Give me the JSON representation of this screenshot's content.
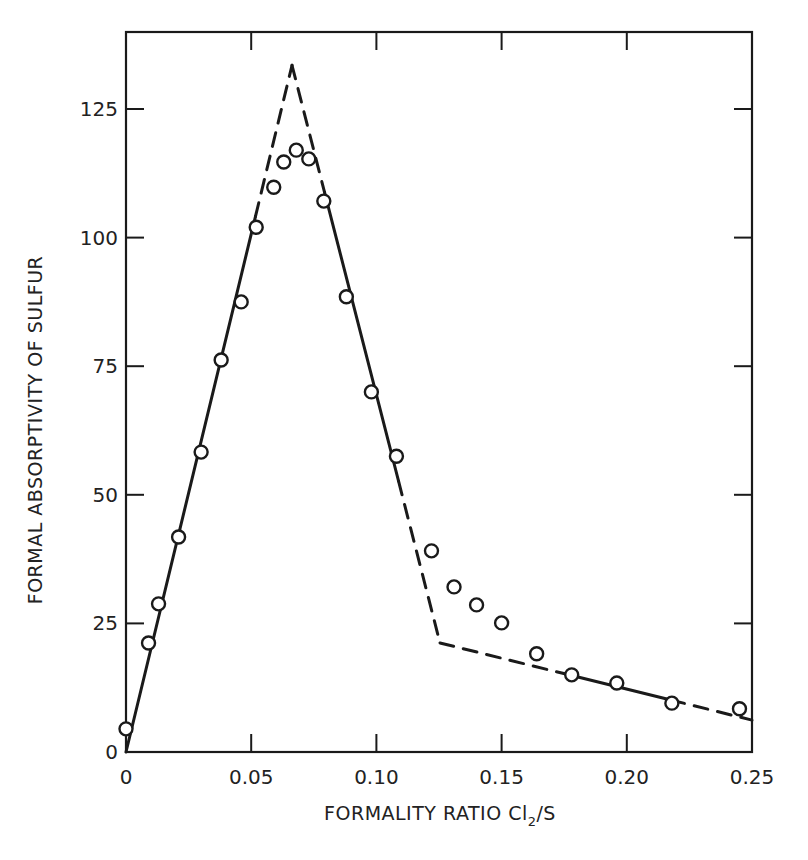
{
  "chart_data": {
    "type": "scatter",
    "title": "",
    "xlabel": "FORMALITY RATIO Cl2/S",
    "xlabel_main": "FORMALITY RATIO Cl",
    "xlabel_sub": "2",
    "xlabel_tail": "/S",
    "ylabel": "FORMAL ABSORPTIVITY OF SULFUR",
    "xlim": [
      0,
      0.25
    ],
    "ylim": [
      0,
      140
    ],
    "grid": false,
    "legend": null,
    "x_ticks": [
      0,
      0.05,
      0.1,
      0.15,
      0.2,
      0.25
    ],
    "x_tick_labels": [
      "0",
      "0.05",
      "0.10",
      "0.15",
      "0.20",
      "0.25"
    ],
    "y_ticks": [
      0,
      25,
      50,
      75,
      100,
      125
    ],
    "y_tick_labels": [
      "0",
      "25",
      "50",
      "75",
      "100",
      "125"
    ],
    "series": [
      {
        "name": "measured",
        "marker": "open-circle",
        "x": [
          0.0,
          0.009,
          0.013,
          0.021,
          0.03,
          0.038,
          0.046,
          0.052,
          0.059,
          0.063,
          0.068,
          0.073,
          0.079,
          0.088,
          0.098,
          0.108,
          0.122,
          0.131,
          0.14,
          0.15,
          0.164,
          0.178,
          0.196,
          0.218,
          0.245
        ],
        "y": [
          4.5,
          21.2,
          28.8,
          41.8,
          58.3,
          76.2,
          87.5,
          102.0,
          109.8,
          114.7,
          117.0,
          115.3,
          107.1,
          88.5,
          70.0,
          57.5,
          39.1,
          32.1,
          28.6,
          25.1,
          19.1,
          15.0,
          13.4,
          9.5,
          8.4
        ]
      },
      {
        "name": "fitted-line",
        "style": "solid-with-dashed-extrapolation",
        "x": [
          0.0,
          0.0663,
          0.1254,
          0.25
        ],
        "y": [
          0.0,
          133.5,
          21.2,
          6.2
        ]
      }
    ]
  }
}
